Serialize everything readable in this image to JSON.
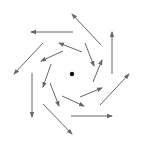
{
  "diagram": {
    "type": "vector-field-vortex",
    "width": 144,
    "height": 148,
    "colors": {
      "background": "#ffffff",
      "arrow": "#666666",
      "center": "#111111"
    },
    "center": {
      "x": 72,
      "y": 74,
      "r": 2.2
    },
    "arrows": [
      {
        "ring": "outer",
        "x1": 73,
        "y1": 32,
        "x2": 31,
        "y2": 32
      },
      {
        "ring": "outer",
        "x1": 101,
        "y1": 45,
        "x2": 72,
        "y2": 14
      },
      {
        "ring": "outer",
        "x1": 112,
        "y1": 74,
        "x2": 112,
        "y2": 32
      },
      {
        "ring": "outer",
        "x1": 100,
        "y1": 105,
        "x2": 129,
        "y2": 74
      },
      {
        "ring": "outer",
        "x1": 71,
        "y1": 116,
        "x2": 112,
        "y2": 116
      },
      {
        "ring": "outer",
        "x1": 43,
        "y1": 104,
        "x2": 72,
        "y2": 134
      },
      {
        "ring": "outer",
        "x1": 32,
        "y1": 73,
        "x2": 32,
        "y2": 117
      },
      {
        "ring": "outer",
        "x1": 43,
        "y1": 43,
        "x2": 14,
        "y2": 74
      },
      {
        "ring": "inner",
        "x1": 82,
        "y1": 52,
        "x2": 59,
        "y2": 43
      },
      {
        "ring": "inner",
        "x1": 63,
        "y1": 51,
        "x2": 41,
        "y2": 61
      },
      {
        "ring": "inner",
        "x1": 85,
        "y1": 43,
        "x2": 94,
        "y2": 66
      },
      {
        "ring": "inner",
        "x1": 93,
        "y1": 82,
        "x2": 102,
        "y2": 60
      },
      {
        "ring": "inner",
        "x1": 80,
        "y1": 97,
        "x2": 102,
        "y2": 88
      },
      {
        "ring": "inner",
        "x1": 62,
        "y1": 96,
        "x2": 84,
        "y2": 106
      },
      {
        "ring": "inner",
        "x1": 51,
        "y1": 64,
        "x2": 43,
        "y2": 87
      },
      {
        "ring": "inner",
        "x1": 50,
        "y1": 83,
        "x2": 59,
        "y2": 106
      }
    ]
  }
}
